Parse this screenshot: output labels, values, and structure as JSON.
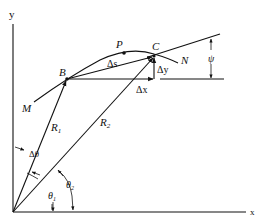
{
  "figure": {
    "axes": {
      "x_label": "x",
      "y_label": "y"
    },
    "curve": {
      "start_label": "M",
      "end_label": "N"
    },
    "points": [
      {
        "name": "B",
        "label": "B"
      },
      {
        "name": "P",
        "label": "P"
      },
      {
        "name": "C",
        "label": "C"
      }
    ],
    "vectors": [
      {
        "name": "R1",
        "label": "R",
        "subscript": "1"
      },
      {
        "name": "R2",
        "label": "R",
        "subscript": "2"
      }
    ],
    "increments": {
      "arc": "Δs",
      "dx": "Δx",
      "dy": "Δy",
      "dtheta": "Δθ"
    },
    "angles": [
      {
        "name": "theta1",
        "label": "θ",
        "subscript": "1"
      },
      {
        "name": "theta2",
        "label": "θ",
        "subscript": "2"
      },
      {
        "name": "psi",
        "label": "ψ"
      }
    ],
    "colors": {
      "ink": "#111111",
      "background": "#ffffff"
    }
  }
}
